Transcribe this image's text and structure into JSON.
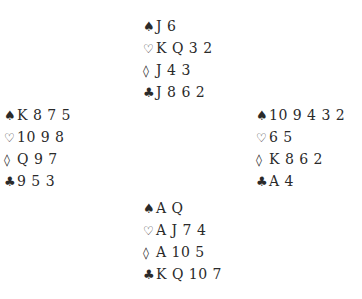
{
  "suit_symbols": {
    "spades": "♠",
    "hearts": "♡",
    "diamonds": "◊",
    "clubs": "♣"
  },
  "hands": {
    "north": {
      "spades": "J 6",
      "hearts": "K Q 3 2",
      "diamonds": "J 4 3",
      "clubs": "J 8 6 2"
    },
    "west": {
      "spades": "K 8 7 5",
      "hearts": "10 9 8",
      "diamonds": "Q 9 7",
      "clubs": "9 5 3"
    },
    "east": {
      "spades": "10 9 4 3 2",
      "hearts": "6 5",
      "diamonds": "K 8 6 2",
      "clubs": "A 4"
    },
    "south": {
      "spades": "A Q",
      "hearts": "A J 7 4",
      "diamonds": "A 10 5",
      "clubs": "K Q 10 7"
    }
  }
}
